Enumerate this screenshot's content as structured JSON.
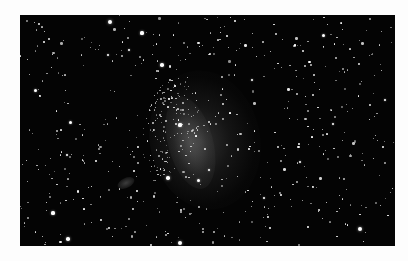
{
  "image": {
    "subject": "star field with faint irregular galaxy",
    "frame": {
      "left": 20,
      "top": 15,
      "width": 375,
      "height": 231
    },
    "colors": {
      "page_background": "#fdfdfd",
      "sky": "#040404",
      "star": "#ffffff"
    },
    "galaxy_center": {
      "x": 170,
      "y": 128
    },
    "bright_stars": [
      {
        "x": 110,
        "y": 22,
        "r": 2.2
      },
      {
        "x": 142,
        "y": 33,
        "r": 1.6
      },
      {
        "x": 108,
        "y": 55,
        "r": 1.4
      },
      {
        "x": 162,
        "y": 65,
        "r": 1.8
      },
      {
        "x": 35,
        "y": 90,
        "r": 1.5
      },
      {
        "x": 70,
        "y": 122,
        "r": 1.5
      },
      {
        "x": 180,
        "y": 125,
        "r": 1.6
      },
      {
        "x": 168,
        "y": 178,
        "r": 1.8
      },
      {
        "x": 198,
        "y": 180,
        "r": 1.5
      },
      {
        "x": 209,
        "y": 170,
        "r": 1.4
      },
      {
        "x": 53,
        "y": 213,
        "r": 1.6
      },
      {
        "x": 68,
        "y": 239,
        "r": 1.8
      },
      {
        "x": 180,
        "y": 243,
        "r": 2.0
      },
      {
        "x": 360,
        "y": 229,
        "r": 2.0
      },
      {
        "x": 323,
        "y": 35,
        "r": 1.5
      },
      {
        "x": 252,
        "y": 80,
        "r": 1.4
      },
      {
        "x": 333,
        "y": 124,
        "r": 1.4
      },
      {
        "x": 385,
        "y": 100,
        "r": 1.3
      },
      {
        "x": 300,
        "y": 162,
        "r": 1.3
      },
      {
        "x": 264,
        "y": 198,
        "r": 1.4
      },
      {
        "x": 129,
        "y": 50,
        "r": 1.4
      },
      {
        "x": 67,
        "y": 155,
        "r": 1.3
      },
      {
        "x": 235,
        "y": 21,
        "r": 1.2
      },
      {
        "x": 396,
        "y": 45,
        "r": 1.2
      }
    ],
    "faint_star_count": 520,
    "seed": 6822
  }
}
